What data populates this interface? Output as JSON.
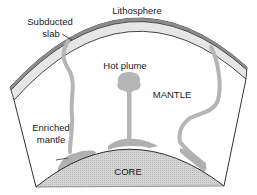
{
  "diagram": {
    "labels": {
      "lithosphere": "Lithosphere",
      "subducted_slab_line1": "Subducted",
      "subducted_slab_line2": "slab",
      "hot_plume": "Hot plume",
      "mantle": "MANTLE",
      "enriched_mantle_line1": "Enriched",
      "enriched_mantle_line2": "mantle",
      "core": "CORE"
    },
    "colors": {
      "lithosphere_fill": "#e6e6e6",
      "lithosphere_dark_band": "#8c8c8c",
      "slab_plume_gray": "#b5b5b5",
      "core_fill": "#cfcfcf",
      "outline": "#1a1a1a",
      "background": "#ffffff"
    }
  }
}
